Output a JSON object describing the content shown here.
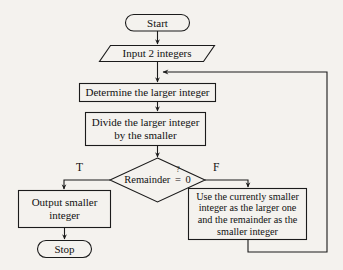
{
  "diagram": {
    "background_color": "#f4f2ee",
    "stroke_color": "#1b1b1b",
    "text_color": "#111111",
    "nodes": {
      "start": {
        "label": "Start",
        "shape": "terminator"
      },
      "input": {
        "label": "Input 2 integers",
        "shape": "parallelogram"
      },
      "determine": {
        "label": "Determine the larger integer",
        "shape": "process"
      },
      "divide": {
        "label": "Divide the larger integer\nby the smaller",
        "shape": "process"
      },
      "decision": {
        "label_prefix": "Remainder",
        "label_operator_top": "?",
        "label_operator": "=",
        "label_value": "0",
        "shape": "decision"
      },
      "output": {
        "label": "Output smaller\ninteger",
        "shape": "process"
      },
      "stop": {
        "label": "Stop",
        "shape": "terminator"
      },
      "update": {
        "label": "Use the currently smaller\ninteger as the larger one\nand the remainder as the\nsmaller integer",
        "shape": "process"
      }
    },
    "branches": {
      "true_label": "T",
      "false_label": "F"
    }
  }
}
